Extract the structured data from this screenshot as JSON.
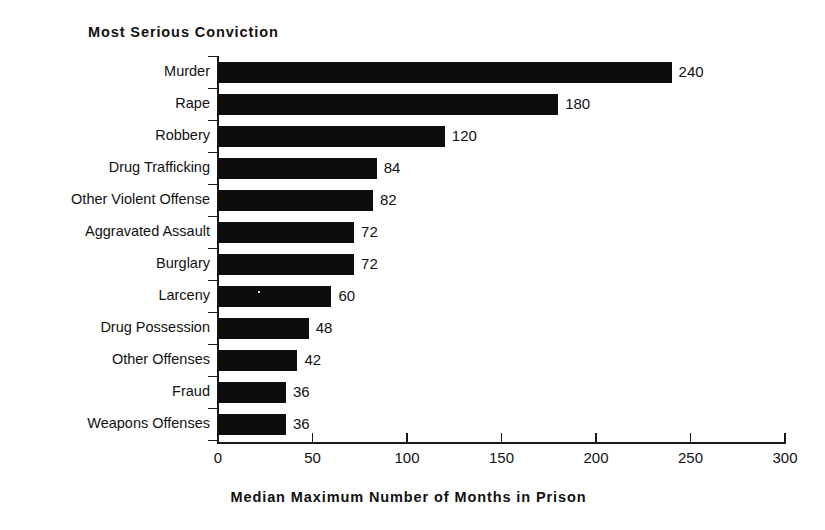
{
  "chart_data": {
    "type": "bar",
    "orientation": "horizontal",
    "title": "Most Serious Conviction",
    "xlabel": "Median Maximum Number of Months in Prison",
    "ylabel": "Most Serious Conviction",
    "xlim": [
      0,
      300
    ],
    "xticks": [
      0,
      50,
      100,
      150,
      200,
      250,
      300
    ],
    "grid": false,
    "legend": false,
    "bar_color": "#0d0d0d",
    "categories": [
      "Murder",
      "Rape",
      "Robbery",
      "Drug Trafficking",
      "Other Violent Offense",
      "Aggravated Assault",
      "Burglary",
      "Larceny",
      "Drug Possession",
      "Other Offenses",
      "Fraud",
      "Weapons Offenses"
    ],
    "values": [
      240,
      180,
      120,
      84,
      82,
      72,
      72,
      60,
      48,
      42,
      36,
      36
    ],
    "value_labels": [
      "240",
      "180",
      "120",
      "84",
      "82",
      "72",
      "72",
      "60",
      "48",
      "42",
      "36",
      "36"
    ],
    "xtick_labels": [
      "0",
      "50",
      "100",
      "150",
      "200",
      "250",
      "300"
    ]
  }
}
